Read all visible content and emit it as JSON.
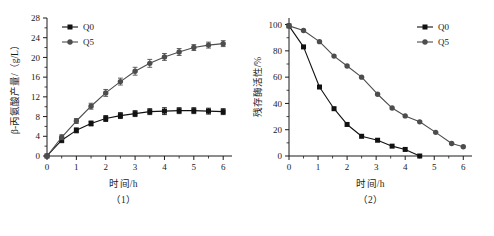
{
  "figure": {
    "background": "#ffffff",
    "ink": "#1a1a1a",
    "series_color_q0": "#111111",
    "series_color_q5": "#4d4d4d"
  },
  "panels": [
    {
      "caption": "（1）",
      "legend": [
        {
          "label": "Q0",
          "marker": "square"
        },
        {
          "label": "Q5",
          "marker": "circle"
        }
      ],
      "chart_data": {
        "type": "line",
        "title": "",
        "subtitle": "",
        "xlabel": "时间/h",
        "ylabel": "β-丙氨酸产量/（g/L）",
        "xlim": [
          0,
          6.3
        ],
        "ylim": [
          0,
          28
        ],
        "xticks": [
          0,
          1,
          2,
          3,
          4,
          5,
          6
        ],
        "xticklabels": [
          "0",
          "1",
          "2",
          "3",
          "4",
          "5",
          "6"
        ],
        "xminorticks": [
          0.5,
          1.5,
          2.5,
          3.5,
          4.5,
          5.5
        ],
        "yticks": [
          0,
          4,
          8,
          12,
          16,
          20,
          24,
          28
        ],
        "yticklabels": [
          "0",
          "4",
          "8",
          "12",
          "16",
          "20",
          "24",
          "28"
        ],
        "grid": false,
        "legend_position": "top-left",
        "errorbars": true,
        "x": [
          0,
          0.5,
          1.0,
          1.5,
          2.0,
          2.5,
          3.0,
          3.5,
          4.0,
          4.5,
          5.0,
          5.5,
          6.0
        ],
        "series": [
          {
            "name": "Q0",
            "marker": "square",
            "values": [
              0,
              3.2,
              5.2,
              6.6,
              7.6,
              8.2,
              8.6,
              9.0,
              9.1,
              9.2,
              9.2,
              9.1,
              9.0
            ],
            "errors": [
              0,
              0.5,
              0.5,
              0.5,
              0.6,
              0.6,
              0.6,
              0.6,
              0.7,
              0.6,
              0.6,
              0.6,
              0.6
            ]
          },
          {
            "name": "Q5",
            "marker": "circle",
            "values": [
              0,
              3.8,
              7.1,
              10.1,
              12.8,
              15.1,
              17.2,
              18.8,
              20.1,
              21.1,
              22.0,
              22.5,
              22.8
            ],
            "errors": [
              0,
              0.5,
              0.5,
              0.6,
              0.7,
              0.7,
              0.8,
              0.8,
              0.7,
              0.7,
              0.6,
              0.6,
              0.6
            ]
          }
        ]
      }
    },
    {
      "caption": "（2）",
      "legend": [
        {
          "label": "Q0",
          "marker": "square"
        },
        {
          "label": "Q5",
          "marker": "circle"
        }
      ],
      "chart_data": {
        "type": "line",
        "title": "",
        "subtitle": "",
        "xlabel": "时间/h",
        "ylabel": "残存酶活性/%",
        "xlim": [
          0,
          6.3
        ],
        "ylim": [
          0,
          105
        ],
        "xticks": [
          0,
          1,
          2,
          3,
          4,
          5,
          6
        ],
        "xticklabels": [
          "0",
          "1",
          "2",
          "3",
          "4",
          "5",
          "6"
        ],
        "xminorticks": [
          0.5,
          1.5,
          2.5,
          3.5,
          4.5,
          5.5
        ],
        "yticks": [
          0,
          20,
          40,
          60,
          80,
          100
        ],
        "yticklabels": [
          "0",
          "20",
          "40",
          "60",
          "80",
          "100"
        ],
        "grid": false,
        "legend_position": "top-right",
        "errorbars": false,
        "x": [
          0,
          0.5,
          1.05,
          1.55,
          2.0,
          2.5,
          3.05,
          3.55,
          4.0,
          4.5
        ],
        "series": [
          {
            "name": "Q0",
            "marker": "square",
            "x": [
              0,
              0.5,
              1.05,
              1.55,
              2.0,
              2.5,
              3.05,
              3.55,
              4.0,
              4.5
            ],
            "values": [
              99,
              83,
              52.5,
              36,
              24,
              15,
              12,
              7.5,
              5,
              0
            ]
          },
          {
            "name": "Q5",
            "marker": "circle",
            "x": [
              0,
              0.5,
              1.05,
              1.55,
              2.0,
              2.5,
              3.05,
              3.55,
              4.0,
              4.5,
              5.05,
              5.6,
              6.0
            ],
            "values": [
              99,
              95.5,
              87,
              76,
              68.5,
              60,
              47,
              36.5,
              30.5,
              26,
              18,
              9.5,
              7
            ]
          }
        ]
      }
    }
  ]
}
